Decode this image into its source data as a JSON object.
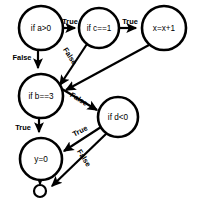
{
  "diagram": {
    "background_color": "#ffffff",
    "stroke_color": "#000000",
    "nodes": [
      {
        "id": "a",
        "label": "if a>0",
        "cx": 41,
        "cy": 28,
        "r": 22,
        "shape": "circle"
      },
      {
        "id": "c",
        "label": "if c==1",
        "cx": 99,
        "cy": 28,
        "r": 20,
        "shape": "circle"
      },
      {
        "id": "x",
        "label": "x=x+1",
        "cx": 164,
        "cy": 28,
        "r": 22,
        "shape": "circle"
      },
      {
        "id": "b",
        "label": "if b==3",
        "cx": 41,
        "cy": 96,
        "r": 22,
        "shape": "circle"
      },
      {
        "id": "d",
        "label": "if d<0",
        "cx": 118,
        "cy": 117,
        "r": 20,
        "shape": "circle"
      },
      {
        "id": "y",
        "label": "y=0",
        "cx": 41,
        "cy": 159,
        "r": 21,
        "shape": "circle"
      },
      {
        "id": "terminal",
        "label": "",
        "cx": 40,
        "cy": 191,
        "r": 6,
        "shape": "circle"
      }
    ],
    "edges": [
      {
        "id": "a-true-c",
        "from": "a",
        "to": "c",
        "label": "True",
        "label_x": 70,
        "label_y": 21,
        "label_rotation": 0
      },
      {
        "id": "a-false-b",
        "from": "a",
        "to": "b",
        "label": "False",
        "label_x": 22,
        "label_y": 57,
        "label_rotation": 0
      },
      {
        "id": "c-true-x",
        "from": "c",
        "to": "x",
        "label": "True",
        "label_x": 130,
        "label_y": 21,
        "label_rotation": 0
      },
      {
        "id": "c-false-b",
        "from": "c",
        "to": "b",
        "label": "False",
        "label_x": 70,
        "label_y": 56,
        "label_rotation": 57
      },
      {
        "id": "x-to-b",
        "from": "x",
        "to": "b",
        "label": "",
        "label_x": 0,
        "label_y": 0,
        "label_rotation": 0
      },
      {
        "id": "b-true-y",
        "from": "b",
        "to": "y",
        "label": "True",
        "label_x": 23,
        "label_y": 127,
        "label_rotation": 0
      },
      {
        "id": "b-false-d",
        "from": "b",
        "to": "d",
        "label": "False",
        "label_x": 79,
        "label_y": 99,
        "label_rotation": 31
      },
      {
        "id": "d-true-y",
        "from": "d",
        "to": "y",
        "label": "True",
        "label_x": 80,
        "label_y": 131,
        "label_rotation": -27
      },
      {
        "id": "d-false-end",
        "from": "d",
        "to": "terminal",
        "label": "False",
        "label_x": 84,
        "label_y": 158,
        "label_rotation": 58
      }
    ]
  }
}
